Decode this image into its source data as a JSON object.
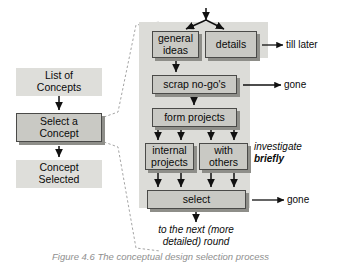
{
  "figure": {
    "caption": "Figure 4.6 The conceptual design selection process",
    "colors": {
      "panel_fill": "#dcdcd8",
      "flat_box_fill": "#dededa",
      "raised_box_fill": "#c9c9c4",
      "box_border": "#4a4a48",
      "box_shadow": "#8e8e89",
      "arrow": "#111111",
      "dashed_connector": "#9a9a9a",
      "text": "#0a0a0a",
      "caption_text": "#8f8f8f"
    }
  },
  "overview": {
    "label": "left overview flow",
    "nodes": [
      {
        "id": "list-of-concepts",
        "text": "List of\nConcepts",
        "line1": "List of",
        "line2": "Concepts",
        "style": "flat"
      },
      {
        "id": "select-a-concept",
        "text": "Select a\nConcept",
        "line1": "Select a",
        "line2": "Concept",
        "style": "raised"
      },
      {
        "id": "concept-selected",
        "text": "Concept\nSelected",
        "line1": "Concept",
        "line2": "Selected",
        "style": "flat"
      }
    ]
  },
  "detail": {
    "label": "expanded detail of Select a Concept",
    "nodes": [
      {
        "id": "general-ideas",
        "line1": "general",
        "line2": "ideas"
      },
      {
        "id": "details",
        "line1": "details",
        "line2": ""
      },
      {
        "id": "scrap-no-gos",
        "line1": "scrap no-go's",
        "line2": ""
      },
      {
        "id": "form-projects",
        "line1": "form projects",
        "line2": ""
      },
      {
        "id": "internal-projects",
        "line1": "internal",
        "line2": "projects"
      },
      {
        "id": "with-others",
        "line1": "with",
        "line2": "others"
      },
      {
        "id": "select",
        "line1": "select",
        "line2": ""
      }
    ],
    "annotations": [
      {
        "id": "till-later",
        "text": "till later",
        "style": "plain"
      },
      {
        "id": "gone-scrap",
        "text": "gone",
        "style": "plain"
      },
      {
        "id": "investigate",
        "text": "investigate",
        "style": "italic"
      },
      {
        "id": "briefly",
        "text": "briefly",
        "style": "bold-italic"
      },
      {
        "id": "gone-select",
        "text": "gone",
        "style": "plain"
      },
      {
        "id": "to-next-round-line1",
        "text": "to the next (more",
        "style": "italic"
      },
      {
        "id": "to-next-round-line2",
        "text": "detailed) round",
        "style": "italic"
      }
    ]
  }
}
